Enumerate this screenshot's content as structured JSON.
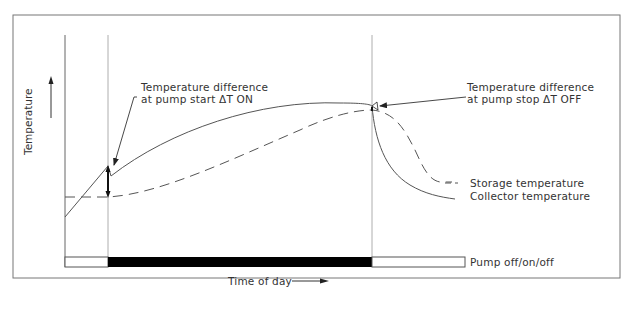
{
  "diagram": {
    "y_axis_label": "Temperature",
    "x_axis_label": "Time of day",
    "annotations": {
      "start_line1": "Temperature difference",
      "start_line2": "at pump start  ΔT ON",
      "stop_line1": "Temperature difference",
      "stop_line2": "at pump stop  ΔT OFF"
    },
    "legend": {
      "storage": "Storage temperature",
      "collector": "Collector temperature",
      "pump": "Pump off/on/off"
    },
    "colors": {
      "line": "#555555",
      "pump_on": "#000000",
      "frame": "#777777"
    }
  }
}
